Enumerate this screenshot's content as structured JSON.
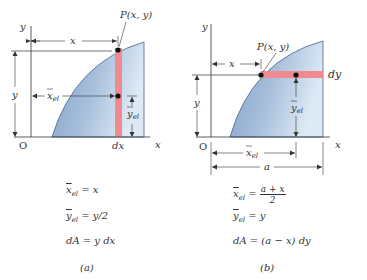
{
  "figure": {
    "panel_a": {
      "caption": "(a)",
      "labels": {
        "y_axis": "y",
        "x_axis": "x",
        "origin": "O",
        "point": "P(x, y)",
        "x_dim": "x",
        "y_dim": "y",
        "xel": "x",
        "xel_sub": "el",
        "yel": "y",
        "yel_sub": "el",
        "differential": "dx"
      },
      "equations": [
        {
          "lhs": "x",
          "sub": "el",
          "rhs": " = x"
        },
        {
          "lhs": "y",
          "sub": "el",
          "rhs": " = y/2"
        },
        {
          "lhs": "dA",
          "sub": "",
          "rhs": " = y dx"
        }
      ]
    },
    "panel_b": {
      "caption": "(b)",
      "labels": {
        "y_axis": "y",
        "x_axis": "x",
        "origin": "O",
        "point": "P(x, y)",
        "x_dim": "x",
        "y_dim": "y",
        "xel": "x",
        "xel_sub": "el",
        "yel": "y",
        "yel_sub": "el",
        "differential": "dy",
        "a_dim": "a"
      },
      "equations": [
        {
          "lhs": "x",
          "sub": "el",
          "rhs": " = ",
          "frac_num": "a + x",
          "frac_den": "2"
        },
        {
          "lhs": "y",
          "sub": "el",
          "rhs": " = y"
        },
        {
          "lhs": "dA",
          "sub": "",
          "rhs": " = (a − x) dy"
        }
      ]
    },
    "colors": {
      "area_fill_light": "#dce8f4",
      "area_fill_dark": "#7f9fc6",
      "strip": "#f08a90",
      "line": "#333333"
    }
  }
}
